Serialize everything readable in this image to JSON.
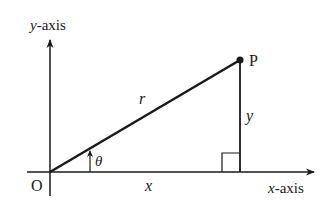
{
  "diagram": {
    "type": "polar-coordinates-triangle",
    "labels": {
      "y_axis_var": "y",
      "y_axis_suffix": "-axis",
      "x_axis_var": "x",
      "x_axis_suffix": "-axis",
      "origin": "O",
      "point": "P",
      "hypotenuse": "r",
      "adjacent": "x",
      "opposite": "y",
      "angle": "θ"
    },
    "colors": {
      "stroke": "#1a1a1a",
      "background": "#ffffff"
    }
  }
}
